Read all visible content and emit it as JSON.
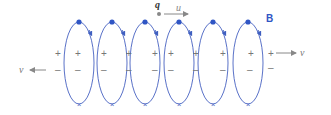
{
  "labels": {
    "charge": "q",
    "charge_velocity": "u",
    "field": "B",
    "velocity_left": "v",
    "velocity_right": "v",
    "plus": "+",
    "minus": "–"
  },
  "colors": {
    "loop": "#3f5fc0",
    "field_label": "#2f55c4",
    "charge_dot": "#888888",
    "text": "#666666",
    "arrow": "#888888"
  },
  "loops": {
    "count": 6,
    "centers_x": [
      79,
      112,
      145,
      178,
      213,
      247
    ],
    "top_y": 22,
    "bottom_y": 104,
    "half_width": 15,
    "top_marker": "dot",
    "bottom_marker": "cross"
  }
}
